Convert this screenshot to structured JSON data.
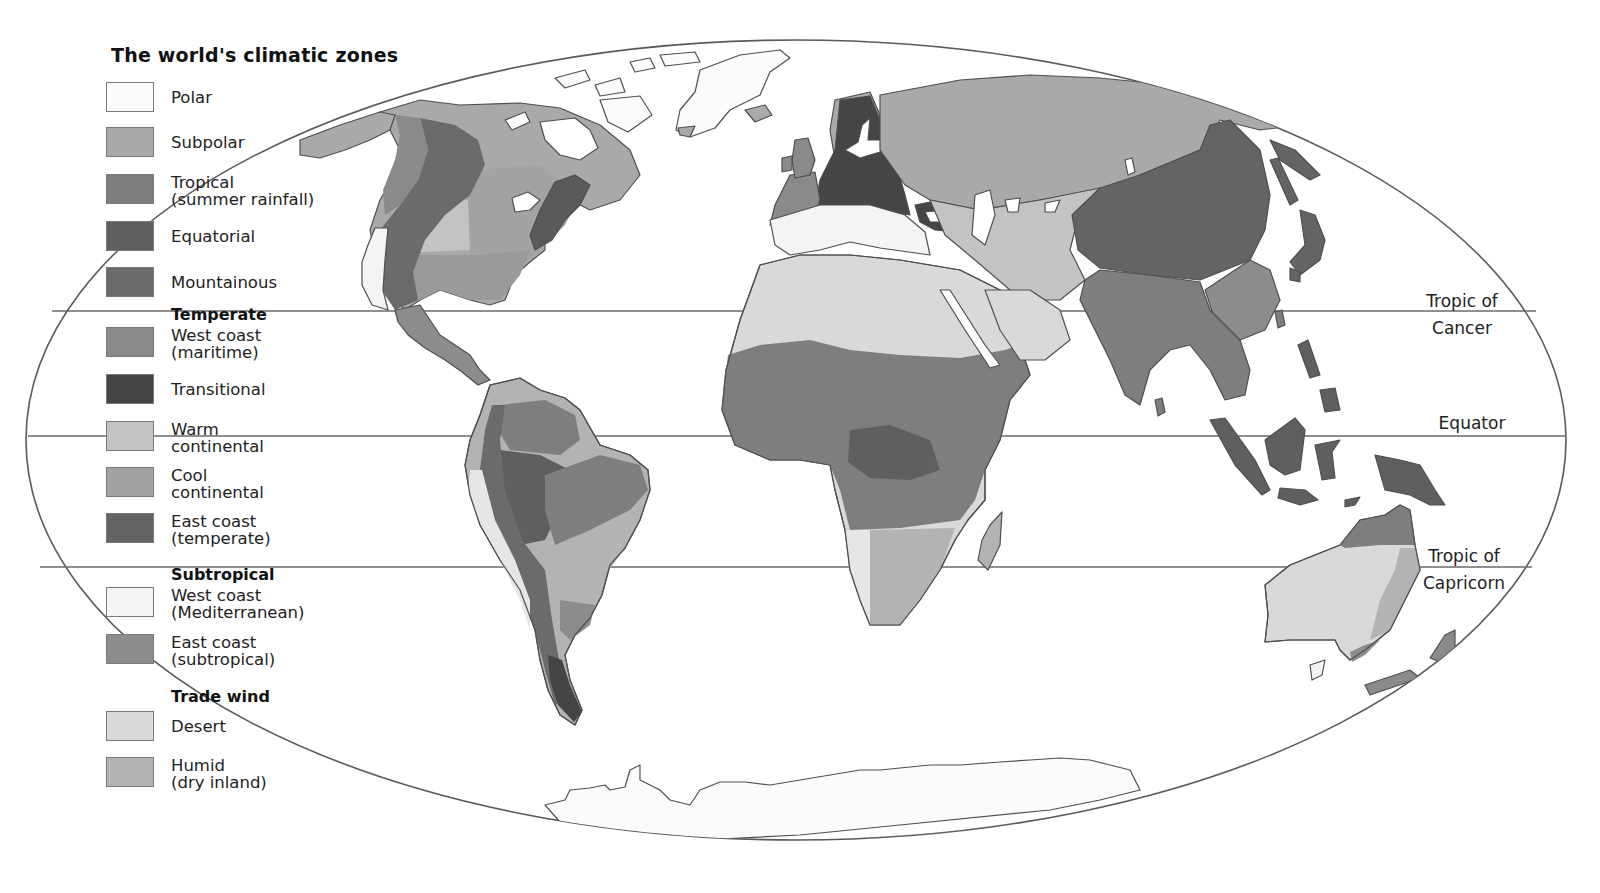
{
  "title": "The world's climatic zones",
  "legend": {
    "groups": [
      {
        "heading": "",
        "items": [
          {
            "label_line1": "Polar",
            "label_line2": "",
            "color": "#fbfbfb"
          },
          {
            "label_line1": "Subpolar",
            "label_line2": "",
            "color": "#a9a9a9"
          },
          {
            "label_line1": "Tropical",
            "label_line2": "(summer rainfall)",
            "color": "#7e7e7e"
          },
          {
            "label_line1": "Equatorial",
            "label_line2": "",
            "color": "#5f5f5f"
          },
          {
            "label_line1": "Mountainous",
            "label_line2": "",
            "color": "#6b6b6b"
          }
        ]
      },
      {
        "heading": "Temperate",
        "items": [
          {
            "label_line1": "West coast",
            "label_line2": "(maritime)",
            "color": "#8a8a8a"
          },
          {
            "label_line1": "Transitional",
            "label_line2": "",
            "color": "#454545"
          },
          {
            "label_line1": "Warm",
            "label_line2": "continental",
            "color": "#c3c3c3"
          },
          {
            "label_line1": "Cool",
            "label_line2": "continental",
            "color": "#a3a3a3"
          },
          {
            "label_line1": "East coast",
            "label_line2": "(temperate)",
            "color": "#646464"
          }
        ]
      },
      {
        "heading": "Subtropical",
        "items": [
          {
            "label_line1": "West coast",
            "label_line2": "(Mediterranean)",
            "color": "#f4f4f4"
          },
          {
            "label_line1": "East coast",
            "label_line2": "(subtropical)",
            "color": "#8c8c8c"
          }
        ]
      },
      {
        "heading": "Trade wind",
        "items": [
          {
            "label_line1": "Desert",
            "label_line2": "",
            "color": "#d9d9d9"
          },
          {
            "label_line1": "Humid",
            "label_line2": "(dry inland)",
            "color": "#b3b3b3"
          }
        ]
      }
    ]
  },
  "map_labels": {
    "tropic_of_cancer": {
      "line1": "Tropic of",
      "line2": "Cancer"
    },
    "equator": {
      "line1": "Equator"
    },
    "tropic_of_capricorn": {
      "line1": "Tropic of",
      "line2": "Capricorn"
    }
  },
  "colors": {
    "outline": "#555555",
    "graticule": "#666666",
    "background": "#ffffff"
  }
}
